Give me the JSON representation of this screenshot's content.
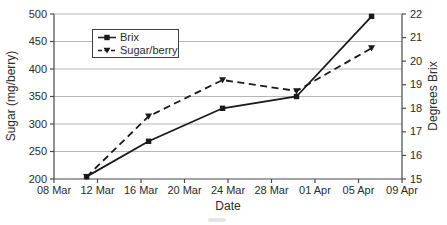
{
  "figure": {
    "background": "#ffffff",
    "text_color": "#2b2b2b",
    "line_color": "#1a1a1a",
    "gridline_color": "#b6b6b6",
    "axis_color": "#4a4a4a"
  },
  "chart_data": {
    "type": "line",
    "title": "",
    "grid": true,
    "x_axis": {
      "title": "Date",
      "labels": [
        "08 Mar",
        "12 Mar",
        "16 Mar",
        "20 Mar",
        "24 Mar",
        "28 Mar",
        "01 Apr",
        "05 Apr",
        "09 Apr"
      ],
      "days_from_start": [
        0,
        4,
        8,
        12,
        16,
        20,
        24,
        28,
        32
      ],
      "days_span": 32
    },
    "left_axis": {
      "title": "Sugar (mg/berry)",
      "min": 200,
      "max": 500,
      "step": 50,
      "ticks": [
        200,
        250,
        300,
        350,
        400,
        450,
        500
      ]
    },
    "right_axis": {
      "title": "Degrees Brix",
      "min": 15,
      "max": 22,
      "step": 1,
      "ticks": [
        15,
        16,
        17,
        18,
        19,
        20,
        21,
        22
      ]
    },
    "legend": {
      "position": "top-left-inside",
      "items": [
        {
          "label": "Brix",
          "marker": "square",
          "line": "solid"
        },
        {
          "label": "Sugar/berry",
          "marker": "triangle-down",
          "line": "dashed"
        }
      ]
    },
    "series": [
      {
        "name": "Brix",
        "axis": "right",
        "marker": "square",
        "line": "solid",
        "x_days": [
          3.0,
          8.7,
          15.5,
          22.3,
          29.2
        ],
        "approx_dates": [
          "11 Mar",
          "17 Mar",
          "24 Mar",
          "30 Mar",
          "06 Apr"
        ],
        "values": [
          15.1,
          16.6,
          18.0,
          18.5,
          21.9
        ]
      },
      {
        "name": "Sugar/berry",
        "axis": "left",
        "marker": "triangle-down",
        "line": "dashed",
        "x_days": [
          3.0,
          8.7,
          15.5,
          22.3,
          29.2
        ],
        "approx_dates": [
          "11 Mar",
          "17 Mar",
          "24 Mar",
          "30 Mar",
          "06 Apr"
        ],
        "values": [
          204,
          314,
          380,
          360,
          438
        ]
      }
    ]
  }
}
